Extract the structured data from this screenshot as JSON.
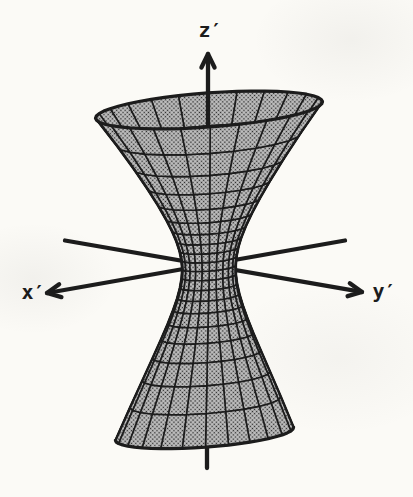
{
  "figure": {
    "type": "hyperboloid-of-one-sheet-diagram",
    "axis_labels": {
      "x": "x′",
      "y": "y′",
      "z": "z′"
    },
    "colors": {
      "ink": "#1c1c1c",
      "mesh_gray": "#b0b0b0",
      "halftone_light": "#c9c9c9",
      "halftone_dark": "#262626",
      "paper": "#fbfaf6"
    }
  }
}
